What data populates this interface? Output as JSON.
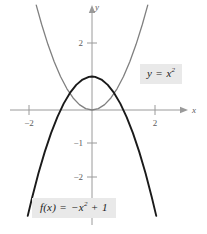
{
  "figure": {
    "kind": "coordinate-plane-graph",
    "background_color": "#ffffff"
  },
  "axes": {
    "x_axis_label": "x",
    "y_axis_label": "y",
    "x_tick_labels": [
      "−2",
      "2"
    ],
    "y_tick_labels": [
      "2",
      "−1",
      "−2"
    ],
    "axis_color": "#9a9a9a",
    "tick_label_color": "#5c5c5c"
  },
  "labels": {
    "gray_curve": {
      "lhs": "y",
      "equals": "=",
      "base": "x",
      "exponent": "2",
      "background_color": "#e9e9e9"
    },
    "dark_curve": {
      "lhs": "f(x)",
      "equals": "=",
      "minus": "−",
      "base": "x",
      "exponent": "2",
      "plus": "+",
      "constant": "1",
      "background_color": "#e9e9e9"
    }
  },
  "chart_data": {
    "type": "line",
    "title": "",
    "xlabel": "x",
    "ylabel": "y",
    "xlim": [
      -2.9,
      2.6
    ],
    "ylim": [
      -3.2,
      3.0
    ],
    "grid": false,
    "legend": "inline-callouts",
    "xticks": [
      -2,
      2
    ],
    "yticks": [
      2,
      -1,
      -2
    ],
    "series": [
      {
        "name": "y = x^2",
        "color": "#808080",
        "width": 1.3,
        "x": [
          -1.77,
          -1.6,
          -1.4,
          -1.2,
          -1.0,
          -0.8,
          -0.6,
          -0.4,
          -0.2,
          0,
          0.2,
          0.4,
          0.6,
          0.8,
          1.0,
          1.2,
          1.4,
          1.6,
          1.77
        ],
        "values": [
          3.13,
          2.56,
          1.96,
          1.44,
          1.0,
          0.64,
          0.36,
          0.16,
          0.04,
          0,
          0.04,
          0.16,
          0.36,
          0.64,
          1.0,
          1.44,
          1.96,
          2.56,
          3.13
        ]
      },
      {
        "name": "f(x) = -x^2 + 1",
        "color": "#1a1a1a",
        "width": 1.9,
        "x": [
          -2.04,
          -1.9,
          -1.7,
          -1.5,
          -1.3,
          -1.1,
          -0.9,
          -0.7,
          -0.5,
          -0.3,
          -0.1,
          0,
          0.1,
          0.3,
          0.5,
          0.7,
          0.9,
          1.1,
          1.3,
          1.5,
          1.7,
          1.9,
          2.04
        ],
        "values": [
          -3.16,
          -2.61,
          -1.89,
          -1.25,
          -0.69,
          -0.21,
          0.19,
          0.51,
          0.75,
          0.91,
          0.99,
          1.0,
          0.99,
          0.91,
          0.75,
          0.51,
          0.19,
          -0.21,
          -0.69,
          -1.25,
          -1.89,
          -2.61,
          -3.16
        ]
      }
    ],
    "intersections": [
      {
        "x": -0.7071,
        "y": 0.5
      },
      {
        "x": 0.7071,
        "y": 0.5
      }
    ]
  }
}
